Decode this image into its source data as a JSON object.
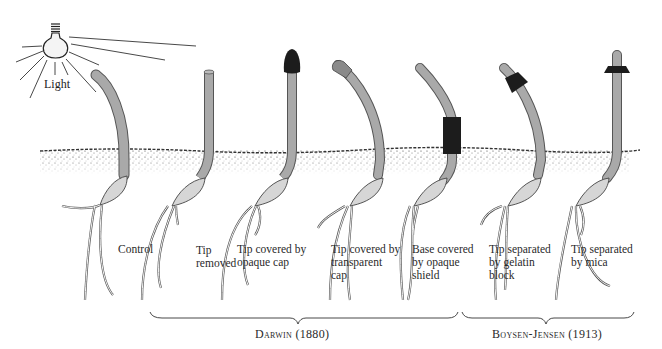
{
  "light": {
    "label": "Light",
    "icon": "light-bulb-icon"
  },
  "colors": {
    "coleoptile": "#a9a9a9",
    "coleoptile_outline": "#555555",
    "opaque": "#1c1c1c",
    "transparent_cap": "#8a8a8a",
    "soil": "#333333",
    "seed": "#d6d6d6"
  },
  "seedlings": [
    {
      "id": "control",
      "lines": [
        "Control"
      ]
    },
    {
      "id": "tip-removed",
      "lines": [
        "Tip",
        "removed"
      ]
    },
    {
      "id": "opaque-cap",
      "lines": [
        "Tip covered by",
        "opaque cap"
      ]
    },
    {
      "id": "transparent-cap",
      "lines": [
        "Tip covered by",
        "transparent",
        "cap"
      ]
    },
    {
      "id": "opaque-shield",
      "lines": [
        "Base covered",
        "by opaque",
        "shield"
      ]
    },
    {
      "id": "gelatin-block",
      "lines": [
        "Tip separated",
        "by gelatin",
        "block"
      ]
    },
    {
      "id": "mica",
      "lines": [
        "Tip separated",
        "by mica"
      ]
    }
  ],
  "groups": [
    {
      "name": "Darwin (1880)"
    },
    {
      "name": "Boysen-Jensen (1913)"
    }
  ]
}
